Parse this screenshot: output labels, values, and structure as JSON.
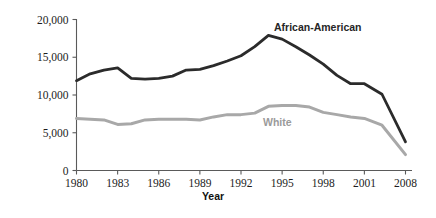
{
  "chart_data": {
    "type": "line",
    "title": "",
    "xlabel": "Year",
    "ylabel": "",
    "xlim": [
      1980,
      2008
    ],
    "ylim": [
      0,
      20000
    ],
    "grid": false,
    "legend_position": "inline-annotation",
    "x_tick_labels": [
      "1980",
      "1983",
      "1986",
      "1989",
      "1992",
      "1995",
      "1998",
      "2001",
      "2008"
    ],
    "y_tick_labels": [
      "0",
      "5,000",
      "10,000",
      "15,000",
      "20,000"
    ],
    "y_tick_values": [
      0,
      5000,
      10000,
      15000,
      20000
    ],
    "x": [
      1980,
      1981,
      1982,
      1983,
      1984,
      1985,
      1986,
      1987,
      1988,
      1989,
      1990,
      1991,
      1992,
      1993,
      1994,
      1995,
      1996,
      1997,
      1998,
      1999,
      2000,
      2001,
      2004,
      2008
    ],
    "series": [
      {
        "name": "African-American",
        "color": "#2b2b2b",
        "values": [
          11900,
          12800,
          13300,
          13600,
          12200,
          12100,
          12200,
          12500,
          13300,
          13400,
          13900,
          14500,
          15200,
          16400,
          17900,
          17400,
          16400,
          15300,
          14100,
          12600,
          11500,
          11500,
          10100,
          3800
        ]
      },
      {
        "name": "White",
        "color": "#a8a8a8",
        "values": [
          6900,
          6800,
          6700,
          6100,
          6200,
          6700,
          6800,
          6800,
          6800,
          6700,
          7100,
          7400,
          7400,
          7600,
          8500,
          8600,
          8600,
          8400,
          7700,
          7400,
          7100,
          6900,
          6000,
          2100
        ]
      }
    ],
    "annotations": [
      {
        "text": "African-American",
        "x_px": 274,
        "y_px": 31,
        "tone": "dark"
      },
      {
        "text": "White",
        "x_px": 263,
        "y_px": 126,
        "tone": "light"
      }
    ]
  },
  "axis": {
    "x_title": "Year"
  }
}
